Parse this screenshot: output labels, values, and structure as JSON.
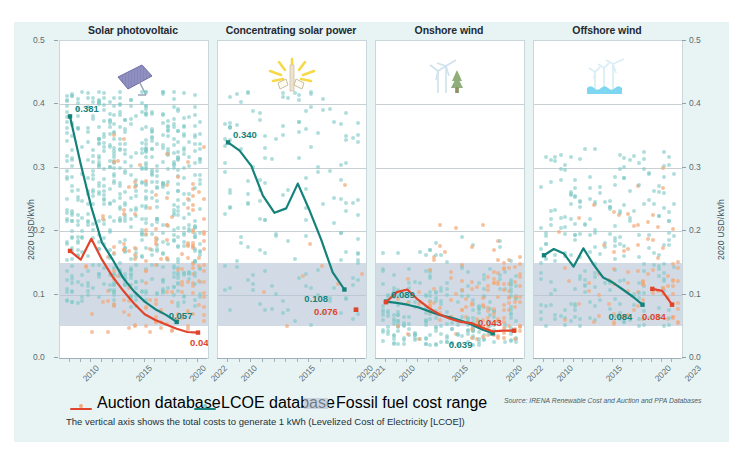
{
  "figure": {
    "background": "#e8f4f4",
    "y_axis_label": "2020 USD/kWh",
    "y_ticks": [
      "0.5",
      "0.4",
      "0.3",
      "0.2",
      "0.1",
      "0.0"
    ],
    "note": "The vertical axis shows the total costs to generate 1 kWh (Levelized Cost of Electricity [LCOE])",
    "source": "Source: IRENA Renewable Cost and Auction and PPA Databases"
  },
  "legend": {
    "auction_label": "Auction database",
    "lcoe_label": "LCOE database",
    "band_label": "Fossil fuel cost range",
    "auction_color": "#e0452c",
    "auction_dot_color": "#f2a97a",
    "lcoe_color": "#14827b",
    "lcoe_dot_color": "#7ec9c6",
    "band_color": "#b6c3d6"
  },
  "chart_data": {
    "type": "line",
    "ylabel": "2020 USD/kWh",
    "xlabel": "",
    "ylim": [
      0.0,
      0.5
    ],
    "yticks": [
      0.0,
      0.1,
      0.2,
      0.3,
      0.4,
      0.5
    ],
    "grid": true,
    "legend_position": "bottom",
    "band": {
      "name": "Fossil fuel cost range",
      "ymin": 0.05,
      "ymax": 0.15
    },
    "panels": [
      {
        "name": "Solar photovoltaic",
        "icon": "solar-panel-icon",
        "xlim": [
          2010,
          2022
        ],
        "xticks": [
          2010,
          2015,
          2020,
          2022
        ],
        "xticklabels": [
          "2010",
          "2015",
          "2020",
          "2022"
        ],
        "series": [
          {
            "name": "LCOE database",
            "color": "#14827b",
            "x": [
              2010,
              2011,
              2012,
              2013,
              2014,
              2015,
              2016,
              2017,
              2018,
              2019,
              2020
            ],
            "values": [
              0.381,
              0.306,
              0.238,
              0.182,
              0.155,
              0.126,
              0.105,
              0.089,
              0.077,
              0.068,
              0.057
            ],
            "start_label": "0.381",
            "end_label": "0.057"
          },
          {
            "name": "Auction database",
            "color": "#e0452c",
            "x": [
              2010,
              2011,
              2012,
              2013,
              2014,
              2015,
              2016,
              2017,
              2018,
              2019,
              2020,
              2021,
              2022
            ],
            "values": [
              0.169,
              0.155,
              0.188,
              0.155,
              0.128,
              0.106,
              0.086,
              0.069,
              0.06,
              0.053,
              0.046,
              0.041,
              0.04
            ],
            "end_label": "0.040"
          }
        ]
      },
      {
        "name": "Concentrating solar power",
        "icon": "csp-sun-icon",
        "xlim": [
          2010,
          2021
        ],
        "xticks": [
          2010,
          2015,
          2020,
          2021
        ],
        "xticklabels": [
          "2010",
          "2015",
          "2020",
          "2021"
        ],
        "series": [
          {
            "name": "LCOE database",
            "color": "#14827b",
            "x": [
              2010,
              2011,
              2012,
              2013,
              2014,
              2015,
              2016,
              2017,
              2018,
              2019,
              2020
            ],
            "values": [
              0.34,
              0.327,
              0.303,
              0.256,
              0.229,
              0.236,
              0.275,
              0.233,
              0.187,
              0.135,
              0.108
            ],
            "start_label": "0.340",
            "end_label": "0.108"
          },
          {
            "name": "Auction database",
            "color": "#e0452c",
            "x": [
              2021
            ],
            "values": [
              0.076
            ],
            "end_label": "0.076"
          }
        ]
      },
      {
        "name": "Onshore wind",
        "icon": "onshore-wind-icon",
        "xlim": [
          2010,
          2022
        ],
        "xticks": [
          2010,
          2015,
          2020,
          2022
        ],
        "xticklabels": [
          "2010",
          "2015",
          "2020",
          "2022"
        ],
        "series": [
          {
            "name": "LCOE database",
            "color": "#14827b",
            "x": [
              2010,
              2011,
              2012,
              2013,
              2014,
              2015,
              2016,
              2017,
              2018,
              2019,
              2020
            ],
            "values": [
              0.089,
              0.087,
              0.084,
              0.08,
              0.074,
              0.068,
              0.064,
              0.059,
              0.053,
              0.045,
              0.039
            ],
            "start_label": "0.089",
            "end_label": "0.039"
          },
          {
            "name": "Auction database",
            "color": "#e0452c",
            "x": [
              2010,
              2011,
              2012,
              2013,
              2014,
              2015,
              2016,
              2017,
              2018,
              2019,
              2020,
              2021,
              2022
            ],
            "values": [
              0.088,
              0.104,
              0.108,
              0.092,
              0.079,
              0.069,
              0.062,
              0.057,
              0.055,
              0.048,
              0.042,
              0.043,
              0.043
            ],
            "end_label": "0.043"
          }
        ]
      },
      {
        "name": "Offshore wind",
        "icon": "offshore-wind-icon",
        "xlim": [
          2010,
          2023
        ],
        "xticks": [
          2010,
          2015,
          2020,
          2023
        ],
        "xticklabels": [
          "2010",
          "2015",
          "2020",
          "2023"
        ],
        "series": [
          {
            "name": "LCOE database",
            "color": "#14827b",
            "x": [
              2010,
              2011,
              2012,
              2013,
              2014,
              2015,
              2016,
              2017,
              2018,
              2019,
              2020
            ],
            "values": [
              0.162,
              0.172,
              0.165,
              0.144,
              0.173,
              0.148,
              0.127,
              0.119,
              0.108,
              0.097,
              0.084
            ],
            "end_label": "0.084"
          },
          {
            "name": "Auction database",
            "color": "#e0452c",
            "x": [
              2021,
              2022,
              2023
            ],
            "values": [
              0.109,
              0.106,
              0.084
            ],
            "end_label": "0.084"
          }
        ]
      }
    ]
  }
}
